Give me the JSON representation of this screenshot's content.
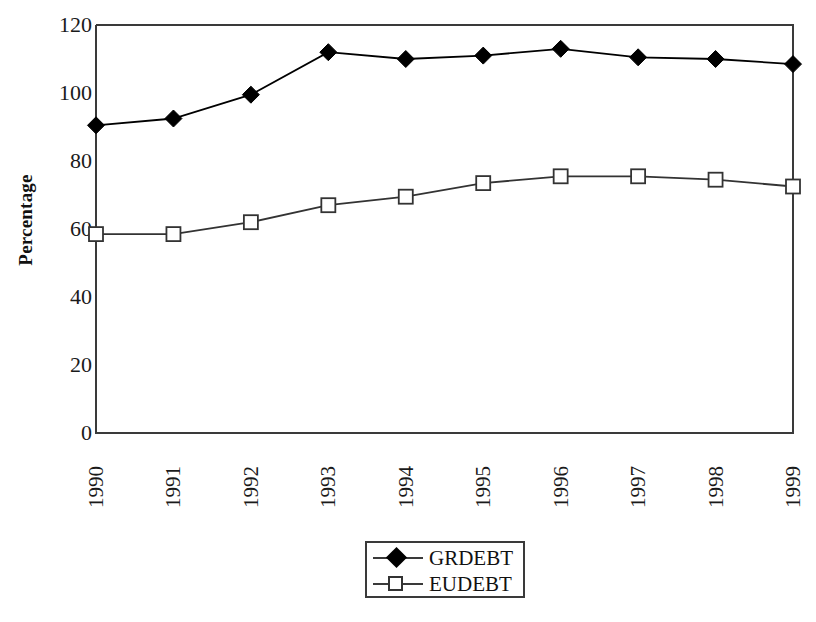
{
  "chart_data": {
    "type": "line",
    "title": "",
    "xlabel": "",
    "ylabel": "Percentage",
    "categories": [
      "1990",
      "1991",
      "1992",
      "1993",
      "1994",
      "1995",
      "1996",
      "1997",
      "1998",
      "1999"
    ],
    "series": [
      {
        "name": "GRDEBT",
        "marker": "filled-diamond",
        "color": "#000000",
        "values": [
          90.5,
          92.5,
          99.5,
          112,
          110,
          111,
          113,
          110.5,
          110,
          108.5
        ]
      },
      {
        "name": "EUDEBT",
        "marker": "open-square",
        "color": "#333333",
        "values": [
          58.5,
          58.5,
          62,
          67,
          69.5,
          73.5,
          75.5,
          75.5,
          74.5,
          72.5
        ]
      }
    ],
    "ylim": [
      0,
      120
    ],
    "y_ticks": [
      "0",
      "20",
      "40",
      "60",
      "80",
      "100",
      "120"
    ],
    "grid": false,
    "legend_position": "bottom-center"
  },
  "axes": {
    "y_title": "Percentage",
    "y_tick_labels": [
      "120",
      "100",
      "80",
      "60",
      "40",
      "20",
      "0"
    ],
    "x_tick_labels": [
      "1990",
      "1991",
      "1992",
      "1993",
      "1994",
      "1995",
      "1996",
      "1997",
      "1998",
      "1999"
    ]
  },
  "legend": {
    "entries": [
      {
        "label": "GRDEBT",
        "marker": "filled-diamond"
      },
      {
        "label": "EUDEBT",
        "marker": "open-square"
      }
    ]
  }
}
